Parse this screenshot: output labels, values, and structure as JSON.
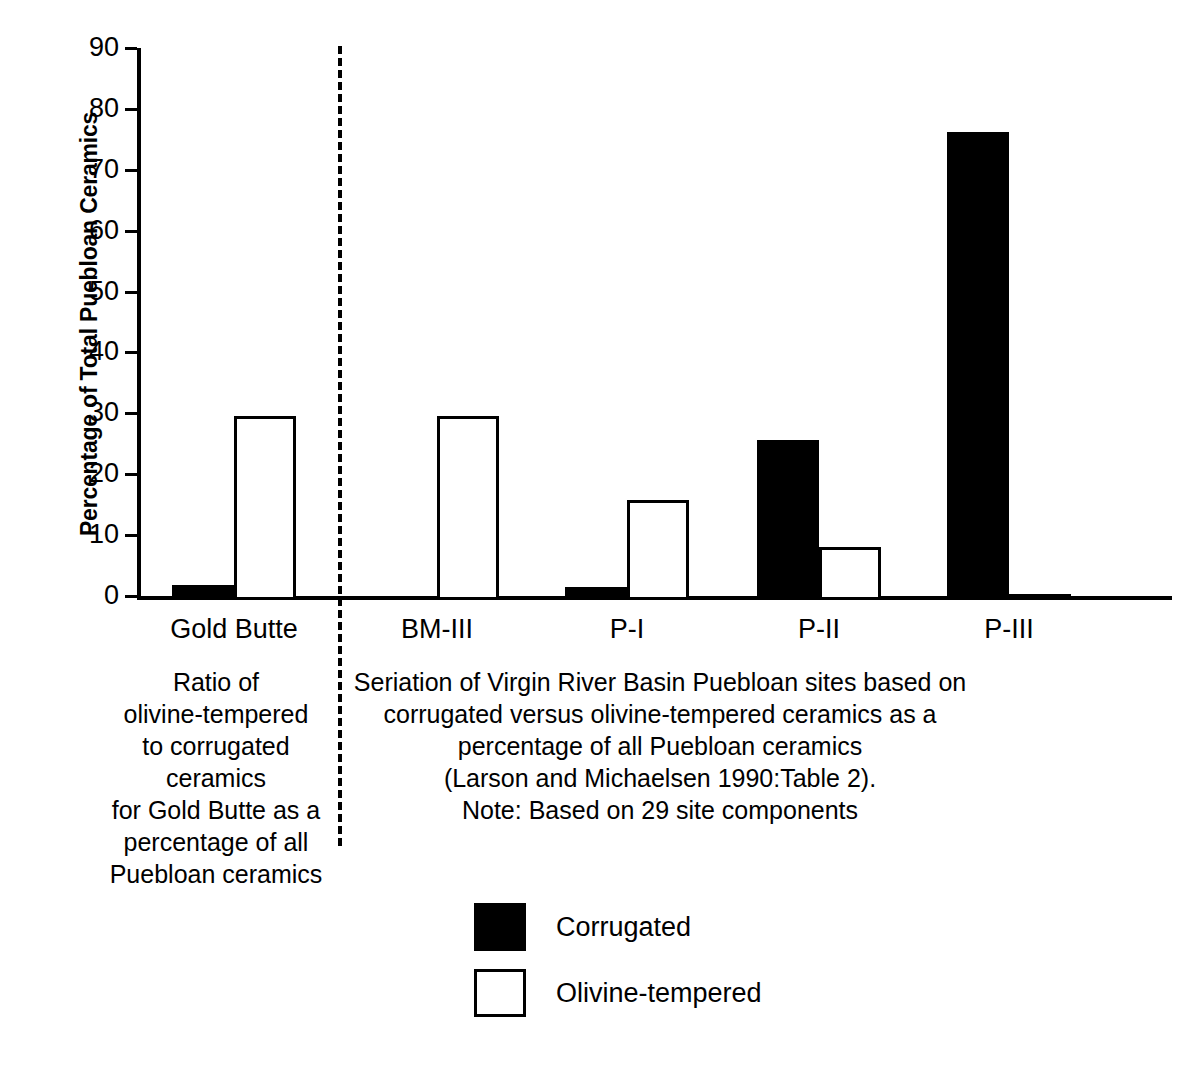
{
  "chart_data": {
    "type": "bar",
    "title": "",
    "xlabel": "",
    "ylabel": "Percentage of Total Puebloan Ceramics",
    "ylim": [
      0,
      90
    ],
    "ytick_labels": [
      "90",
      "80",
      "70",
      "60",
      "50",
      "40",
      "30",
      "20",
      "10",
      "0"
    ],
    "yticks": [
      90,
      80,
      70,
      60,
      50,
      40,
      30,
      20,
      10,
      0
    ],
    "grid": false,
    "legend_position": "bottom-center",
    "categories": [
      "Gold Butte",
      "BM-III",
      "P-I",
      "P-II",
      "P-III"
    ],
    "series": [
      {
        "name": "Corrugated",
        "color": "#000000",
        "values": [
          2.5,
          0,
          2.1,
          26.3,
          76.8
        ]
      },
      {
        "name": "Olivine-tempered",
        "color": "#ffffff",
        "values": [
          30.3,
          30.2,
          16.5,
          8.7,
          0.4
        ]
      }
    ],
    "annotations": {
      "divider": "dashed vertical line separating Gold Butte from Virgin River Basin seriation"
    }
  },
  "axis": {
    "y_title": "Percentage of Total Puebloan Ceramics"
  },
  "x_labels": {
    "gold_butte": "Gold Butte",
    "bm_iii": "BM-III",
    "p_i": "P-I",
    "p_ii": "P-II",
    "p_iii": "P-III"
  },
  "captions": {
    "left": "Ratio of\nolivine-tempered\nto corrugated ceramics\nfor Gold Butte as a\npercentage of all\nPuebloan ceramics",
    "right": "Seriation of Virgin River Basin Puebloan sites based on\ncorrugated versus olivine-tempered ceramics as a\npercentage of all Puebloan ceramics\n(Larson and Michaelsen 1990:Table 2).\nNote: Based on 29 site components"
  },
  "legend": {
    "items": [
      {
        "label": "Corrugated",
        "color": "#000000"
      },
      {
        "label": "Olivine-tempered",
        "color": "#ffffff"
      }
    ]
  }
}
